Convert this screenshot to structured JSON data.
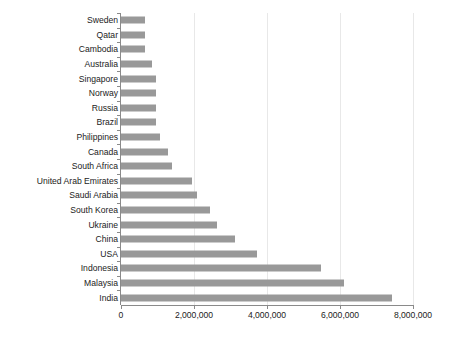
{
  "chart_data": {
    "type": "bar",
    "orientation": "horizontal",
    "title": "",
    "subtitle": "",
    "xlabel": "",
    "ylabel": "",
    "xlim": [
      0,
      8000000
    ],
    "ylim": null,
    "grid": true,
    "grid_axis": "x",
    "legend": false,
    "legend_position": "none",
    "bar_color": "#999999",
    "axis_color": "#8a8a8a",
    "gridline_color": "#e8e8e8",
    "text_color": "#1b1b1b",
    "categories": [
      "Sweden",
      "Qatar",
      "Cambodia",
      "Australia",
      "Singapore",
      "Norway",
      "Russia",
      "Brazil",
      "Philippines",
      "Canada",
      "South Africa",
      "United Arab Emirates",
      "Saudi Arabia",
      "South Korea",
      "Ukraine",
      "China",
      "USA",
      "Indonesia",
      "Malaysia",
      "India"
    ],
    "values": [
      650000,
      650000,
      650000,
      850000,
      950000,
      950000,
      950000,
      960000,
      1070000,
      1290000,
      1400000,
      1950000,
      2080000,
      2450000,
      2630000,
      3120000,
      3720000,
      5480000,
      6100000,
      7430000
    ],
    "xticks": [
      0,
      2000000,
      4000000,
      6000000,
      8000000
    ],
    "xtick_labels": [
      "0",
      "2,000,000",
      "4,000,000",
      "6,000,000",
      "8,000,000"
    ]
  }
}
